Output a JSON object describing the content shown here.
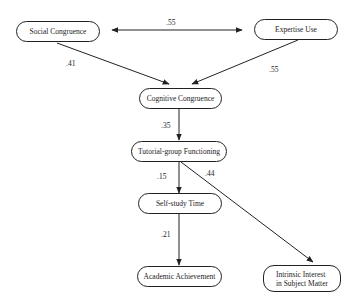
{
  "diagram": {
    "type": "path-model",
    "nodes": {
      "social_congruence": {
        "label": "Social Congruence"
      },
      "expertise_use": {
        "label": "Expertise Use"
      },
      "cognitive_congruence": {
        "label": "Cognitive Congruence"
      },
      "tutorial_group_functioning": {
        "label": "Tutorial-group Functioning"
      },
      "self_study_time": {
        "label": "Self-study Time"
      },
      "academic_achievement": {
        "label": "Academic Achievement"
      },
      "intrinsic_interest": {
        "label_line1": "Intrinsic Interest",
        "label_line2": "in Subject Matter"
      }
    },
    "edges": [
      {
        "from": "social_congruence",
        "to": "expertise_use",
        "bidirectional": true,
        "coefficient": ".55"
      },
      {
        "from": "social_congruence",
        "to": "cognitive_congruence",
        "coefficient": ".41"
      },
      {
        "from": "expertise_use",
        "to": "cognitive_congruence",
        "coefficient": ".55"
      },
      {
        "from": "cognitive_congruence",
        "to": "tutorial_group_functioning",
        "coefficient": ".35"
      },
      {
        "from": "tutorial_group_functioning",
        "to": "self_study_time",
        "coefficient": ".15"
      },
      {
        "from": "tutorial_group_functioning",
        "to": "intrinsic_interest",
        "coefficient": ".44"
      },
      {
        "from": "self_study_time",
        "to": "academic_achievement",
        "coefficient": ".21"
      }
    ],
    "colors": {
      "stroke": "#222222",
      "background": "#ffffff",
      "text": "#222222"
    }
  }
}
